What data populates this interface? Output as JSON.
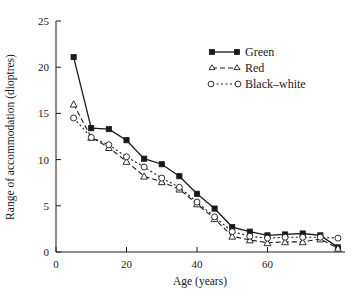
{
  "chart_data": {
    "type": "line",
    "title": "",
    "xlabel": "Age (years)",
    "ylabel": "Range of accommodation (dioptres)",
    "xlim": [
      0,
      82
    ],
    "ylim": [
      0,
      25
    ],
    "xticks": [
      0,
      20,
      40,
      60
    ],
    "yticks": [
      0,
      5,
      10,
      15,
      20,
      25
    ],
    "grid": false,
    "legend_position": "top-right",
    "x": [
      5,
      10,
      15,
      20,
      25,
      30,
      35,
      40,
      45,
      50,
      55,
      60,
      65,
      70,
      75,
      80
    ],
    "series": [
      {
        "name": "Green",
        "marker": "filled-square",
        "linestyle": "solid",
        "values": [
          21.1,
          13.4,
          13.3,
          12.1,
          10.1,
          9.5,
          8.2,
          6.3,
          4.7,
          2.7,
          2.2,
          1.8,
          1.9,
          2.0,
          1.8,
          0.5
        ]
      },
      {
        "name": "Red",
        "marker": "open-triangle",
        "linestyle": "dashed",
        "values": [
          16.0,
          12.4,
          11.3,
          9.8,
          8.2,
          7.6,
          6.8,
          5.2,
          3.6,
          1.7,
          1.3,
          1.0,
          1.1,
          1.1,
          1.4,
          0.4
        ]
      },
      {
        "name": "Black–white",
        "marker": "open-circle",
        "linestyle": "dotted",
        "values": [
          14.5,
          12.4,
          11.6,
          10.3,
          9.2,
          8.0,
          7.0,
          5.4,
          3.8,
          2.2,
          1.7,
          1.5,
          1.6,
          1.6,
          1.6,
          1.5
        ]
      }
    ],
    "legend": [
      {
        "label": "Green",
        "marker": "filled-square",
        "linestyle": "solid"
      },
      {
        "label": "Red",
        "marker": "open-triangle",
        "linestyle": "dashed"
      },
      {
        "label": "Black–white",
        "marker": "open-circle",
        "linestyle": "dotted"
      }
    ]
  }
}
